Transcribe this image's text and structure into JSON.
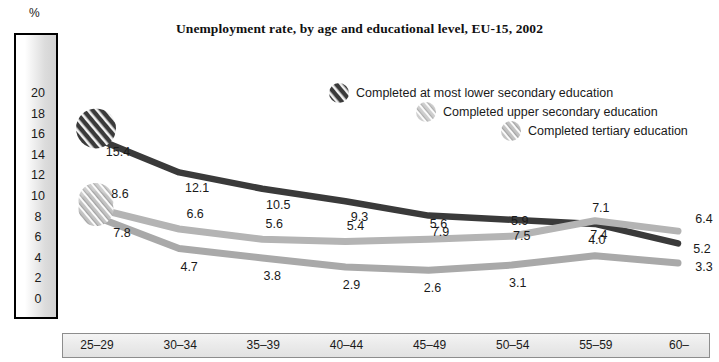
{
  "chart_data": {
    "type": "line",
    "title": "Unemployment rate, by age and educational level, EU-15, 2002",
    "xlabel": "",
    "ylabel": "%",
    "categories": [
      "25–29",
      "30–34",
      "35–39",
      "40–44",
      "45–49",
      "50–54",
      "55–59",
      "60–64"
    ],
    "ylim": [
      0,
      21
    ],
    "yticks": [
      20,
      18,
      16,
      14,
      12,
      10,
      8,
      6,
      4,
      2,
      0
    ],
    "grid": false,
    "legend_position": "inside-upper-right",
    "series": [
      {
        "name": "Completed at most lower secondary education",
        "color": "#3a3a3a",
        "marker": "dark-hatched-circle-icon",
        "values": [
          15.4,
          12.1,
          10.5,
          9.3,
          7.9,
          7.5,
          7.1,
          5.2
        ],
        "labels": [
          "15.4",
          "12.1",
          "10.5",
          "9.3",
          "7.9",
          "7.5",
          "7.1",
          "5.2"
        ]
      },
      {
        "name": "Completed upper secondary education",
        "color": "#b4b4b4",
        "marker": "light-hatched-circle-icon",
        "values": [
          8.6,
          6.6,
          5.6,
          5.4,
          5.6,
          5.9,
          7.4,
          6.4
        ],
        "labels": [
          "8.6",
          "6.6",
          "5.6",
          "5.4",
          "5.6",
          "5.9",
          "7.4",
          "6.4"
        ]
      },
      {
        "name": "Completed tertiary education",
        "color": "#a9a9a9",
        "marker": "mid-hatched-circle-icon",
        "values": [
          7.8,
          4.7,
          3.8,
          2.9,
          2.6,
          3.1,
          4.0,
          3.3
        ],
        "labels": [
          "7.8",
          "4.7",
          "3.8",
          "2.9",
          "2.6",
          "3.1",
          "4.0",
          "3.3"
        ]
      }
    ]
  },
  "axis": {
    "unit_label": "%",
    "y_ticks": [
      "20",
      "18",
      "16",
      "14",
      "12",
      "10",
      "8",
      "6",
      "4",
      "2",
      "0"
    ],
    "x_ticks": [
      "25–29",
      "30–34",
      "35–39",
      "40–44",
      "45–49",
      "50–54",
      "55–59",
      "60–64"
    ]
  },
  "legend": {
    "items": [
      {
        "label": "Completed at most lower secondary education",
        "color": "#3a3a3a",
        "icon": "dark-hatched-circle-icon"
      },
      {
        "label": "Completed upper secondary education",
        "color": "#b4b4b4",
        "icon": "light-hatched-circle-icon"
      },
      {
        "label": "Completed tertiary education",
        "color": "#a9a9a9",
        "icon": "mid-hatched-circle-icon"
      }
    ]
  },
  "value_labels": {
    "lower_secondary": [
      "15.4",
      "12.1",
      "10.5",
      "9.3",
      "7.9",
      "7.5",
      "7.1",
      "5.2"
    ],
    "upper_secondary": [
      "8.6",
      "6.6",
      "5.6",
      "5.4",
      "5.6",
      "5.9",
      "7.4",
      "6.4"
    ],
    "tertiary": [
      "7.8",
      "4.7",
      "3.8",
      "2.9",
      "2.6",
      "3.1",
      "4.0",
      "3.3"
    ]
  }
}
